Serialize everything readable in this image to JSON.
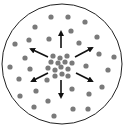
{
  "diagram": {
    "boundary": {
      "cx": 62,
      "cy": 64,
      "r": 60,
      "stroke": "#222222"
    },
    "dot_color": "#7a7a7a",
    "dot_radius": 2.6,
    "arrow_color": "#111111",
    "outer_particles": [
      [
        51,
        17
      ],
      [
        68,
        17
      ],
      [
        85,
        22
      ],
      [
        35,
        27
      ],
      [
        71,
        31
      ],
      [
        97,
        37
      ],
      [
        15,
        44
      ],
      [
        29,
        40
      ],
      [
        49,
        39
      ],
      [
        79,
        43
      ],
      [
        25,
        58
      ],
      [
        99,
        54
      ],
      [
        114,
        57
      ],
      [
        10,
        67
      ],
      [
        30,
        69
      ],
      [
        86,
        66
      ],
      [
        108,
        70
      ],
      [
        19,
        79
      ],
      [
        47,
        80
      ],
      [
        102,
        87
      ],
      [
        36,
        91
      ],
      [
        72,
        89
      ],
      [
        89,
        94
      ],
      [
        20,
        96
      ],
      [
        48,
        101
      ],
      [
        34,
        107
      ],
      [
        73,
        109
      ],
      [
        88,
        109
      ],
      [
        54,
        116
      ]
    ],
    "cluster_particles": [
      [
        53,
        56
      ],
      [
        60,
        58
      ],
      [
        67,
        56
      ],
      [
        51,
        62
      ],
      [
        58,
        63
      ],
      [
        65,
        62
      ],
      [
        72,
        63
      ],
      [
        48,
        68
      ],
      [
        55,
        70
      ],
      [
        61,
        67
      ],
      [
        68,
        69
      ],
      [
        55,
        76
      ],
      [
        62,
        74
      ],
      [
        68,
        76
      ]
    ],
    "arrows": [
      {
        "name": "up",
        "x1": 61,
        "y1": 48,
        "x2": 61,
        "y2": 32
      },
      {
        "name": "upper-left",
        "x1": 48,
        "y1": 57,
        "x2": 31,
        "y2": 49
      },
      {
        "name": "upper-right",
        "x1": 75,
        "y1": 57,
        "x2": 92,
        "y2": 48
      },
      {
        "name": "lower-left",
        "x1": 48,
        "y1": 73,
        "x2": 32,
        "y2": 81
      },
      {
        "name": "lower-right",
        "x1": 76,
        "y1": 73,
        "x2": 92,
        "y2": 81
      },
      {
        "name": "down",
        "x1": 61,
        "y1": 80,
        "x2": 61,
        "y2": 97
      }
    ]
  }
}
